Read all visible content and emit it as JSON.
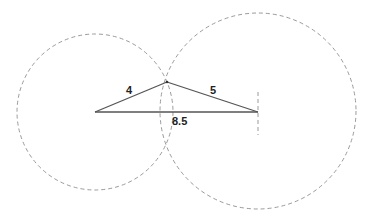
{
  "diagram": {
    "type": "triangle-construction",
    "colors": {
      "background": "#ffffff",
      "line": "#555555",
      "circle": "#999999",
      "text": "#222222"
    },
    "points": {
      "A": {
        "x": 95,
        "y": 112
      },
      "B": {
        "x": 258,
        "y": 112
      },
      "C": {
        "x": 167,
        "y": 82
      }
    },
    "sides": [
      {
        "name": "AC",
        "label": "4",
        "label_pos": {
          "x": 126,
          "y": 94
        }
      },
      {
        "name": "CB",
        "label": "5",
        "label_pos": {
          "x": 210,
          "y": 94
        }
      },
      {
        "name": "AB",
        "label": "8.5",
        "label_pos": {
          "x": 172,
          "y": 125
        }
      }
    ],
    "circles": [
      {
        "name": "circle-radius-4",
        "cx": 95,
        "cy": 112,
        "r": 78
      },
      {
        "name": "circle-radius-5",
        "cx": 258,
        "cy": 111,
        "r": 98
      }
    ],
    "tick_arc": {
      "x": 258,
      "y1": 92,
      "y2": 135
    }
  }
}
